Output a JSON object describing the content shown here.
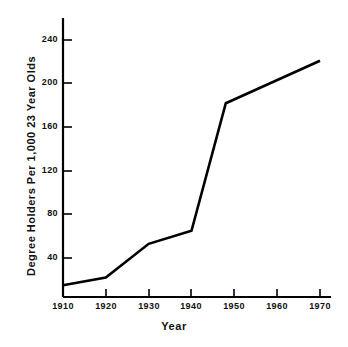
{
  "chart_data": {
    "type": "line",
    "title": "",
    "xlabel": "Year",
    "ylabel": "Degree Holders Per 1,000 23 Year Olds",
    "xlim": [
      1910,
      1970
    ],
    "ylim": [
      0,
      255
    ],
    "xticks": [
      1910,
      1920,
      1930,
      1940,
      1950,
      1960,
      1970
    ],
    "xticklabels": [
      "1910",
      "1920",
      "1930",
      "1940",
      "1950",
      "1960",
      "1970"
    ],
    "yticks": [
      40,
      80,
      120,
      160,
      200,
      240
    ],
    "yticklabels": [
      "40",
      "80",
      "120",
      "160",
      "200",
      "240"
    ],
    "grid": false,
    "legend": false,
    "line_color": "#000000",
    "background_color": "#ffffff",
    "series": [
      {
        "name": "Degree Holders Per 1,000 23 Year Olds",
        "x": [
          1910,
          1920,
          1930,
          1940,
          1948,
          1970
        ],
        "values": [
          15,
          22,
          53,
          65,
          182,
          221
        ]
      }
    ]
  }
}
